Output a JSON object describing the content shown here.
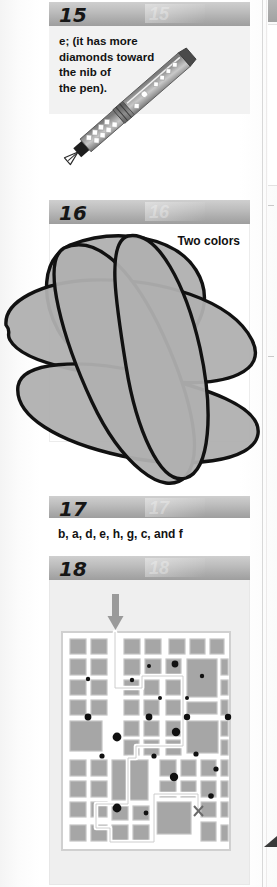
{
  "page": {
    "type": "puzzle-answer-key-column",
    "background_color": "#fdfdfd",
    "header_band_color": "#b4b4b4",
    "block_gray": "#a8a8a8",
    "ink_black": "#121212"
  },
  "sections": [
    {
      "number": "15",
      "answer_text": "e; (it has more\ndiamonds toward\nthe nib of\nthe pen).",
      "illustration": "fountain-pen-with-diamond-pattern",
      "illustration_label": "fountain pen drawn diagonally with rows of white diamonds along the barrel"
    },
    {
      "number": "16",
      "answer_text": "Two colors",
      "illustration": "overlapping-closed-loops",
      "illustration_label": "four large overlapping closed curves shaded gray, two-colorable map"
    },
    {
      "number": "17",
      "answer_text": "b, a, d, e, h, g, c, and f",
      "illustration": "none",
      "illustration_label": ""
    },
    {
      "number": "18",
      "answer_text": "",
      "illustration": "city-block-maze-with-solution-path",
      "illustration_label": "grid of gray city blocks with black dots; white traced route from top arrow to X exit",
      "entry_marker": "down-arrow",
      "exit_marker": "X"
    }
  ],
  "gutter": {
    "has_vertical_rule": true,
    "has_corner_wedge": true
  }
}
